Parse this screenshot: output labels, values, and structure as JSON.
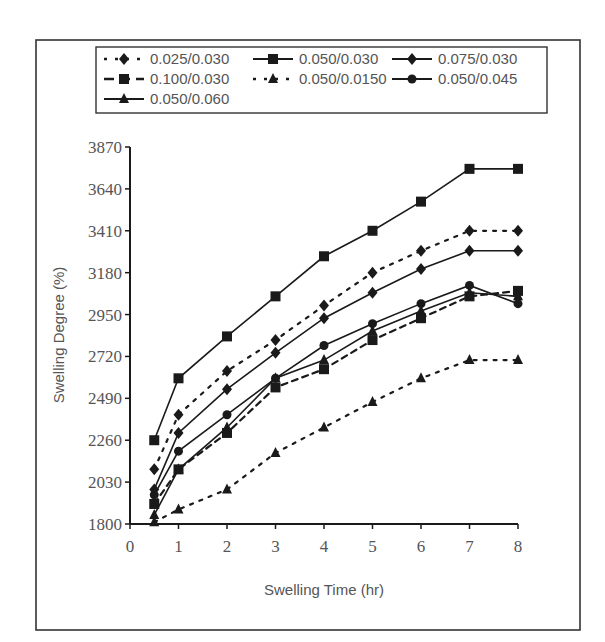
{
  "chart_data": {
    "type": "line",
    "title": "",
    "xlabel": "Swelling Time (hr)",
    "ylabel": "Swelling Degree (%)",
    "xlim": [
      0,
      8
    ],
    "ylim": [
      1800,
      3870
    ],
    "x_ticks": [
      "0",
      "1",
      "2",
      "3",
      "4",
      "5",
      "6",
      "7",
      "8"
    ],
    "y_ticks": [
      "3870",
      "3640",
      "3410",
      "3180",
      "2950",
      "2720",
      "2490",
      "2260",
      "2030",
      "1800"
    ],
    "grid": false,
    "legend_position": "top",
    "x": [
      0.5,
      1,
      2,
      3,
      4,
      5,
      6,
      7,
      8
    ],
    "series": [
      {
        "name": "0.025/0.030",
        "line": "dotted",
        "marker": "diamond",
        "values": [
          2100,
          2400,
          2640,
          2810,
          3000,
          3180,
          3300,
          3410,
          3410
        ]
      },
      {
        "name": "0.050/0.030",
        "line": "solid",
        "marker": "square",
        "values": [
          2260,
          2600,
          2830,
          3050,
          3270,
          3410,
          3570,
          3750,
          3750
        ]
      },
      {
        "name": "0.075/0.030",
        "line": "solid",
        "marker": "diamond",
        "values": [
          1990,
          2300,
          2540,
          2740,
          2930,
          3070,
          3200,
          3300,
          3300
        ]
      },
      {
        "name": "0.100/0.030",
        "line": "dashed",
        "marker": "square",
        "values": [
          1910,
          2100,
          2300,
          2550,
          2650,
          2810,
          2930,
          3050,
          3080
        ]
      },
      {
        "name": "0.050/0.0150",
        "line": "dotted",
        "marker": "triangle",
        "values": [
          1810,
          1880,
          1990,
          2190,
          2330,
          2470,
          2600,
          2700,
          2700
        ]
      },
      {
        "name": "0.050/0.045",
        "line": "solid",
        "marker": "circle",
        "values": [
          1960,
          2200,
          2400,
          2600,
          2780,
          2900,
          3010,
          3110,
          3010
        ]
      },
      {
        "name": "0.050/0.060",
        "line": "solid",
        "marker": "triangle",
        "values": [
          1850,
          2100,
          2330,
          2600,
          2700,
          2860,
          2970,
          3070,
          3050
        ]
      }
    ]
  },
  "legend": {
    "items": [
      "0.025/0.030",
      "0.050/0.030",
      "0.075/0.030",
      "0.100/0.030",
      "0.050/0.0150",
      "0.050/0.045",
      "0.050/0.060"
    ]
  },
  "colors": {
    "line": "#1a1a1a",
    "frame": "#333333",
    "text": "#555555"
  }
}
